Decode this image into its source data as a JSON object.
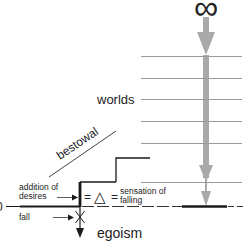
{
  "diagram": {
    "symbol_top": "∞",
    "labels": {
      "worlds": "worlds",
      "bestowal": "bestowal",
      "addition_line1": "addition of",
      "addition_line2": "desires",
      "equation_eq1": "=",
      "equation_delta": "△",
      "equation_eq2": "=",
      "sensation_line1": "sensation of",
      "sensation_line2": "falling",
      "fall": "fall",
      "egoism": "egoism",
      "zero": "0"
    },
    "colors": {
      "arrow_gray": "#a9a9a9",
      "line_gray": "#9a9a9a",
      "ink": "#1a1a1a"
    },
    "world_lines_count": 6
  }
}
